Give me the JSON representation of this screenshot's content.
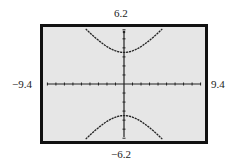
{
  "window": {
    "ymax_label": "6.2",
    "ymin_label": "−6.2",
    "xmin_label": "−9.4",
    "xmax_label": "9.4"
  },
  "colors": {
    "screen_bg": "#e6e6e6",
    "frame": "#111111",
    "curve": "#222222",
    "axis": "#222222"
  },
  "chart_data": {
    "type": "line",
    "title": "",
    "xlabel": "",
    "ylabel": "",
    "xlim": [
      -9.4,
      9.4
    ],
    "ylim": [
      -6.2,
      6.2
    ],
    "grid": false,
    "x_tick_spacing": 1,
    "y_tick_spacing": 1,
    "series": [
      {
        "name": "upper branch",
        "x": [
          -4.5,
          -3,
          -1.5,
          0,
          1.5,
          3,
          4.5
        ],
        "y": [
          6.1,
          5.0,
          3.9,
          3.5,
          3.9,
          5.0,
          6.1
        ]
      },
      {
        "name": "lower branch",
        "x": [
          -4.5,
          -3,
          -1.5,
          0,
          1.5,
          3,
          4.5
        ],
        "y": [
          -6.1,
          -5.0,
          -3.9,
          -3.5,
          -3.9,
          -5.0,
          -6.1
        ]
      }
    ]
  }
}
